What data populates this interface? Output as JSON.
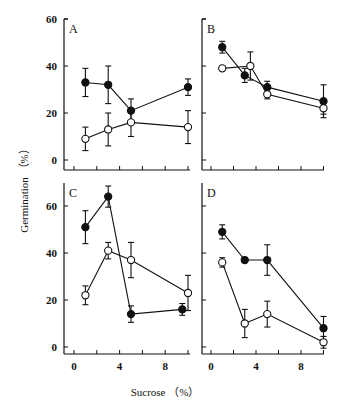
{
  "figure": {
    "ylabel": "Germination （%）",
    "xlabel": "Sucrose （%）"
  },
  "chart_data": [
    {
      "type": "line",
      "panel": "A",
      "xlabel": "Sucrose (%)",
      "ylabel": "Germination (%)",
      "xlim": [
        0,
        10
      ],
      "ylim": [
        0,
        60
      ],
      "xticks": [
        0,
        4,
        8
      ],
      "yticks": [
        0,
        20,
        40,
        60
      ],
      "series": [
        {
          "name": "filled",
          "marker": "filled-circle",
          "x": [
            1,
            3,
            5,
            10
          ],
          "values": [
            33,
            32,
            21,
            31
          ],
          "err": [
            6,
            8,
            5,
            3.5
          ]
        },
        {
          "name": "open",
          "marker": "open-circle",
          "x": [
            1,
            3,
            5,
            10
          ],
          "values": [
            9,
            13,
            16,
            14
          ],
          "err": [
            5,
            7,
            6,
            7
          ]
        }
      ]
    },
    {
      "type": "line",
      "panel": "B",
      "xlabel": "Sucrose (%)",
      "ylabel": "Germination (%)",
      "xlim": [
        0,
        10
      ],
      "ylim": [
        0,
        60
      ],
      "xticks": [
        0,
        4,
        8
      ],
      "yticks": [
        0,
        20,
        40,
        60
      ],
      "series": [
        {
          "name": "filled",
          "marker": "filled-circle",
          "x": [
            1,
            3,
            5,
            10
          ],
          "values": [
            48,
            36,
            31,
            25
          ],
          "err": [
            2.5,
            3,
            2.5,
            7
          ]
        },
        {
          "name": "open",
          "marker": "open-circle",
          "x": [
            1,
            3.5,
            5,
            10
          ],
          "values": [
            39,
            40,
            28,
            22
          ],
          "err": [
            1,
            6,
            2,
            2.5
          ]
        }
      ]
    },
    {
      "type": "line",
      "panel": "C",
      "xlabel": "Sucrose (%)",
      "ylabel": "Germination (%)",
      "xlim": [
        0,
        10
      ],
      "ylim": [
        0,
        60
      ],
      "xticks": [
        0,
        4,
        8
      ],
      "yticks": [
        0,
        20,
        40,
        60
      ],
      "series": [
        {
          "name": "filled",
          "marker": "filled-circle",
          "x": [
            1,
            3,
            5,
            9.5
          ],
          "values": [
            51,
            64,
            14,
            16
          ],
          "err": [
            7,
            4.5,
            3.5,
            2.5
          ]
        },
        {
          "name": "open",
          "marker": "open-circle",
          "x": [
            1,
            3,
            5,
            10
          ],
          "values": [
            22,
            41,
            37,
            23
          ],
          "err": [
            4,
            3.5,
            7.5,
            7.5
          ]
        }
      ]
    },
    {
      "type": "line",
      "panel": "D",
      "xlabel": "Sucrose (%)",
      "ylabel": "Germination (%)",
      "xlim": [
        0,
        10
      ],
      "ylim": [
        0,
        60
      ],
      "xticks": [
        0,
        4,
        8
      ],
      "yticks": [
        0,
        20,
        40,
        60
      ],
      "series": [
        {
          "name": "filled",
          "marker": "filled-circle",
          "x": [
            1,
            3,
            5,
            10
          ],
          "values": [
            49,
            37,
            37,
            8
          ],
          "err": [
            3,
            1,
            6.5,
            5
          ]
        },
        {
          "name": "open",
          "marker": "open-circle",
          "x": [
            1,
            3,
            5,
            10
          ],
          "values": [
            36,
            10,
            14,
            2
          ],
          "err": [
            2,
            6,
            5.5,
            2.5
          ]
        }
      ]
    }
  ],
  "panels": [
    {
      "letter": "A",
      "ytick_labels": [
        "0",
        "20",
        "40",
        "60"
      ],
      "xtick_labels": []
    },
    {
      "letter": "B",
      "ytick_labels": [],
      "xtick_labels": []
    },
    {
      "letter": "C",
      "ytick_labels": [
        "0",
        "20",
        "40",
        "60"
      ],
      "xtick_labels": [
        "0",
        "4",
        "8"
      ]
    },
    {
      "letter": "D",
      "ytick_labels": [],
      "xtick_labels": [
        "0",
        "4",
        "8"
      ]
    }
  ]
}
